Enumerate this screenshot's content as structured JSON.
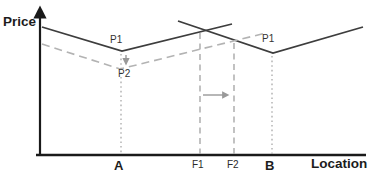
{
  "diagram": {
    "y_axis_label": "Price",
    "x_axis_label": "Location",
    "ticks": {
      "a": "A",
      "f1": "F1",
      "f2": "F2",
      "b": "B"
    },
    "point_labels": {
      "p1_at_a": "P1",
      "p2_at_a": "P2",
      "p1_at_b": "P1"
    },
    "colors": {
      "axis": "#1a1a1a",
      "solid": "#3d3d3d",
      "dashed": "#b3b3b3",
      "guide": "#a8a8a8",
      "arrow": "#999999"
    },
    "lines": [
      {
        "name": "x-axis",
        "type": "line",
        "x1": 36,
        "y1": 155,
        "x2": 366,
        "y2": 155,
        "color": "axis",
        "width": 2.6
      },
      {
        "name": "y-axis",
        "type": "line",
        "x1": 40,
        "y1": 156,
        "x2": 40,
        "y2": 12,
        "color": "axis",
        "width": 2.2,
        "marker": "black"
      },
      {
        "name": "price-schedule-a-p1",
        "type": "polyline",
        "points": [
          [
            42,
            27
          ],
          [
            122,
            51
          ],
          [
            232,
            24
          ]
        ],
        "color": "solid",
        "width": 1.8
      },
      {
        "name": "price-schedule-b-p1",
        "type": "polyline",
        "points": [
          [
            178,
            21
          ],
          [
            273,
            53
          ],
          [
            363,
            27
          ]
        ],
        "color": "solid",
        "width": 1.8
      },
      {
        "name": "price-schedule-a-p2",
        "type": "polyline",
        "points": [
          [
            42,
            44
          ],
          [
            120,
            69
          ],
          [
            266,
            33
          ]
        ],
        "color": "dashed",
        "width": 1.6,
        "dash": "8 5"
      },
      {
        "name": "guide-dotted-a",
        "type": "line",
        "x1": 121,
        "y1": 54,
        "x2": 121,
        "y2": 154,
        "color": "guide",
        "width": 1.3,
        "dash": "1.6 3"
      },
      {
        "name": "guide-dotted-b",
        "type": "line",
        "x1": 272,
        "y1": 56,
        "x2": 272,
        "y2": 154,
        "color": "guide",
        "width": 1.3,
        "dash": "1.6 3"
      },
      {
        "name": "guide-dashed-f1",
        "type": "line",
        "x1": 200,
        "y1": 33,
        "x2": 200,
        "y2": 154,
        "color": "guide",
        "width": 1.4,
        "dash": "6 4.5"
      },
      {
        "name": "guide-dashed-f2",
        "type": "line",
        "x1": 234,
        "y1": 43,
        "x2": 234,
        "y2": 154,
        "color": "guide",
        "width": 1.4,
        "dash": "6 4.5"
      },
      {
        "name": "price-drop-arrow",
        "type": "line",
        "x1": 126,
        "y1": 55,
        "x2": 126,
        "y2": 63,
        "color": "arrow",
        "width": 1.4,
        "marker": "gray"
      },
      {
        "name": "boundary-shift-arrow",
        "type": "line",
        "x1": 203,
        "y1": 95,
        "x2": 227,
        "y2": 95,
        "color": "arrow",
        "width": 1.4,
        "marker": "gray"
      }
    ]
  }
}
